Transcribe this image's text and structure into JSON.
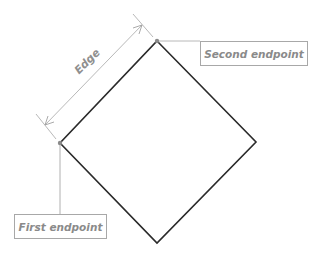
{
  "diagram": {
    "shape": "square rotated 45 degrees (diamond)",
    "vertices": {
      "top": [
        157,
        41
      ],
      "right": [
        256,
        142
      ],
      "bottom": [
        157,
        243
      ],
      "left": [
        60,
        143
      ]
    },
    "labels": {
      "edge": "Edge",
      "second_endpoint": "Second endpoint",
      "first_endpoint": "First endpoint"
    },
    "colors": {
      "shape_stroke": "#2a2a2a",
      "annotation": "#a0a0a0",
      "text": "#8a8a8a"
    }
  }
}
